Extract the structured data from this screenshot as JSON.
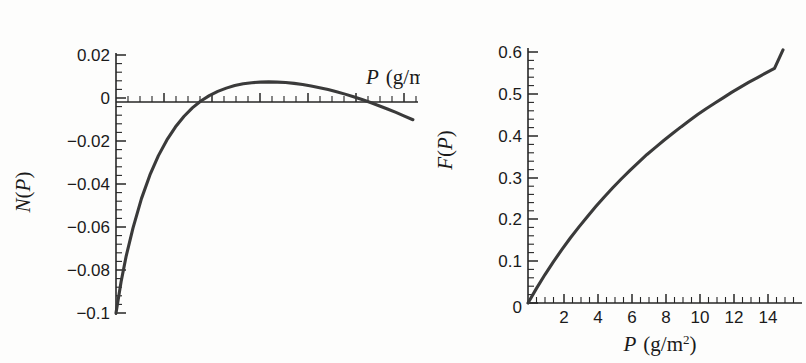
{
  "figure": {
    "background_color": "#fdfdfc",
    "curve_color": "#3a3a3a",
    "axis_color": "#262626"
  },
  "panels": {
    "left": {
      "name": "net-growth-plot",
      "y_axis_title_parts": {
        "var": "N",
        "open": "(",
        "arg": "P",
        "close": ")"
      },
      "x_axis_title_parts": {
        "var": "P",
        "unit": "(g/m",
        "exp": "2",
        "close": ")"
      },
      "y_tick_labels": [
        "0.02",
        "0",
        "−0.02",
        "−0.04",
        "−0.06",
        "−0.08",
        "−0.1"
      ]
    },
    "right": {
      "name": "fraction-plot",
      "y_axis_title_parts": {
        "var": "F",
        "open": "(",
        "arg": "P",
        "close": ")"
      },
      "x_axis_title_parts": {
        "var": "P",
        "unit": "(g/m",
        "exp": "2",
        "close": ")"
      },
      "y_tick_labels": [
        "0.6",
        "0.5",
        "0.4",
        "0.3",
        "0.2",
        "0.1",
        "0"
      ],
      "x_tick_labels": [
        "0",
        "2",
        "4",
        "6",
        "8",
        "10",
        "12",
        "14"
      ]
    }
  },
  "chart_data": [
    {
      "type": "line",
      "name": "left-panel-N-of-P",
      "title": "",
      "xlabel": "P (g/m^2)",
      "ylabel": "N(P)",
      "xlim": [
        0,
        17.8
      ],
      "ylim": [
        -0.1,
        0.02
      ],
      "xticks": [],
      "yticks": [
        0.02,
        0,
        -0.02,
        -0.04,
        -0.06,
        -0.08,
        -0.1
      ],
      "ytick_labels": [
        "0.02",
        "0",
        "−0.02",
        "−0.04",
        "−0.06",
        "−0.08",
        "−0.1"
      ],
      "grid": false,
      "legend": "none",
      "annotations": [
        "axis line drawn at N = 0 across full width",
        "x axis tick marks shown without numeric labels"
      ],
      "series": [
        {
          "name": "N(P)",
          "x": [
            0.0,
            0.3,
            0.6,
            1.0,
            1.5,
            2.0,
            2.5,
            3.0,
            3.5,
            4.0,
            4.5,
            5.0,
            5.5,
            6.0,
            6.5,
            7.0,
            7.5,
            8.0,
            8.5,
            9.0,
            9.5,
            10.0,
            10.5,
            11.0,
            11.5,
            12.0,
            12.5,
            13.0,
            13.5,
            14.0,
            14.5,
            15.0,
            15.5,
            16.0,
            16.5,
            17.0,
            17.5
          ],
          "y": [
            -0.1,
            -0.0855,
            -0.0735,
            -0.0605,
            -0.0468,
            -0.0358,
            -0.0268,
            -0.0195,
            -0.0135,
            -0.0086,
            -0.0046,
            -0.0014,
            0.0011,
            0.0031,
            0.0046,
            0.0058,
            0.0066,
            0.0071,
            0.0074,
            0.0075,
            0.0074,
            0.0072,
            0.0068,
            0.0063,
            0.0056,
            0.0048,
            0.0039,
            0.0029,
            0.0018,
            0.0006,
            -0.0007,
            -0.0021,
            -0.0036,
            -0.0051,
            -0.0067,
            -0.0084,
            -0.0101
          ]
        }
      ],
      "zero_crossings": [
        5.3,
        14.15
      ],
      "maximum": {
        "x": 9.0,
        "y": 0.0075
      }
    },
    {
      "type": "line",
      "name": "right-panel-F-of-P",
      "title": "",
      "xlabel": "P (g/m^2)",
      "ylabel": "F(P)",
      "xlim": [
        0,
        15.5
      ],
      "ylim": [
        0,
        0.63
      ],
      "xticks": [
        0,
        2,
        4,
        6,
        8,
        10,
        12,
        14
      ],
      "xtick_labels": [
        "0",
        "2",
        "4",
        "6",
        "8",
        "10",
        "12",
        "14"
      ],
      "yticks": [
        0,
        0.1,
        0.2,
        0.3,
        0.4,
        0.5,
        0.6
      ],
      "ytick_labels": [
        "0",
        "0.1",
        "0.2",
        "0.3",
        "0.4",
        "0.5",
        "0.6"
      ],
      "grid": false,
      "legend": "none",
      "annotations": [
        "monotonically increasing saturating curve through the origin"
      ],
      "series": [
        {
          "name": "F(P)",
          "x": [
            0.0,
            0.5,
            1.0,
            1.5,
            2.0,
            2.5,
            3.0,
            3.5,
            4.0,
            4.5,
            5.0,
            5.5,
            6.0,
            6.5,
            7.0,
            7.5,
            8.0,
            8.5,
            9.0,
            9.5,
            10.0,
            10.5,
            11.0,
            11.5,
            12.0,
            12.5,
            13.0,
            13.5,
            14.0,
            14.5,
            15.0
          ],
          "y": [
            0.0,
            0.035,
            0.068,
            0.099,
            0.128,
            0.156,
            0.182,
            0.207,
            0.231,
            0.254,
            0.276,
            0.297,
            0.317,
            0.336,
            0.355,
            0.372,
            0.389,
            0.405,
            0.421,
            0.436,
            0.451,
            0.465,
            0.478,
            0.491,
            0.504,
            0.516,
            0.528,
            0.539,
            0.55,
            0.561,
            0.605
          ]
        }
      ]
    }
  ]
}
